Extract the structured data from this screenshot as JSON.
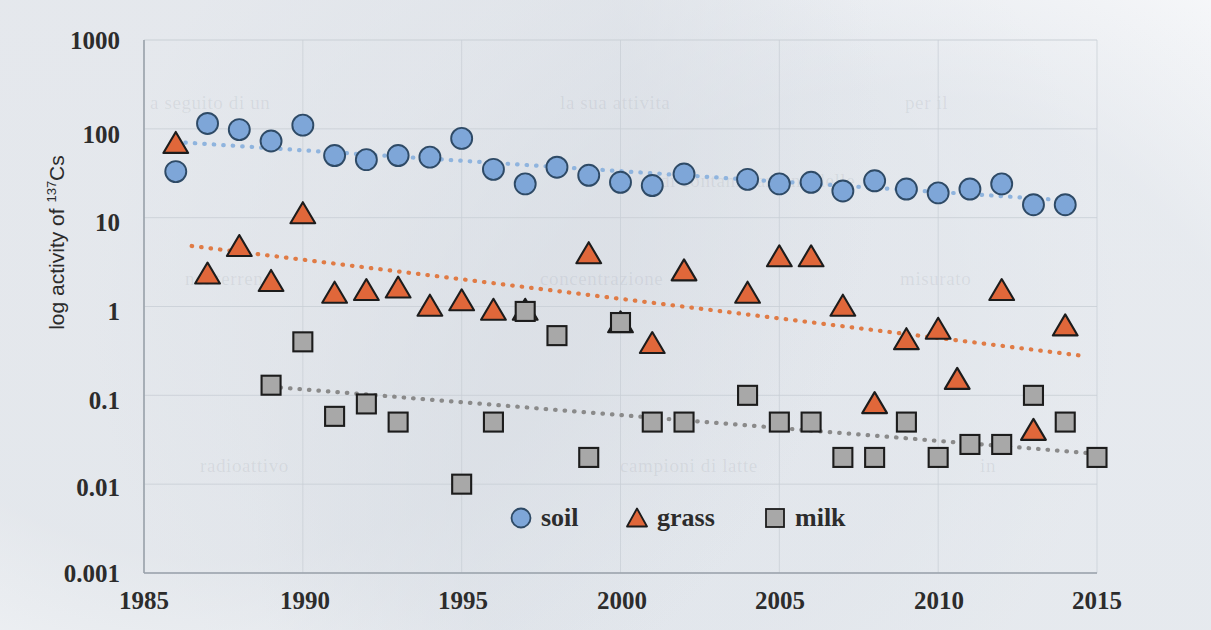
{
  "chart_data": {
    "type": "scatter",
    "title": "",
    "xlabel": "",
    "ylabel": "log activity of 137Cs",
    "ylabel_main": "log activity of ",
    "ylabel_sup": "137",
    "ylabel_tail": "Cs",
    "xlim": [
      1985,
      2015
    ],
    "ylim": [
      0.001,
      1000
    ],
    "yscale": "log",
    "xscale": "linear",
    "grid": true,
    "legend_position": "bottom-center",
    "xticks": [
      "1985",
      "1990",
      "1995",
      "2000",
      "2005",
      "2010",
      "2015"
    ],
    "xtick_values": [
      1985,
      1990,
      1995,
      2000,
      2005,
      2010,
      2015
    ],
    "yticks": [
      "1000",
      "100",
      "10",
      "1",
      "0.1",
      "0.01",
      "0.001"
    ],
    "ytick_values": [
      1000,
      100,
      10,
      1,
      0.1,
      0.01,
      0.001
    ],
    "colors": {
      "soil": "#7EA6D8",
      "soil_edge": "#2e4a66",
      "grass": "#E0673A",
      "grass_edge": "#1c1c1c",
      "milk": "#A8A8A8",
      "milk_edge": "#1c1c1c",
      "soil_trend": "#8FB4DE",
      "grass_trend": "#E07B45",
      "milk_trend": "#8A8A8A",
      "grid": "#c9cfd6",
      "axis": "#9aa2ab",
      "text": "#2c2c2c"
    },
    "series": [
      {
        "name": "soil",
        "marker": "circle",
        "color": "#7EA6D8",
        "points": [
          {
            "x": 1986,
            "y": 33
          },
          {
            "x": 1987,
            "y": 115
          },
          {
            "x": 1988,
            "y": 98
          },
          {
            "x": 1989,
            "y": 73
          },
          {
            "x": 1990,
            "y": 110
          },
          {
            "x": 1991,
            "y": 50
          },
          {
            "x": 1992,
            "y": 45
          },
          {
            "x": 1993,
            "y": 50
          },
          {
            "x": 1994,
            "y": 48
          },
          {
            "x": 1995,
            "y": 78
          },
          {
            "x": 1996,
            "y": 35
          },
          {
            "x": 1997,
            "y": 24
          },
          {
            "x": 1998,
            "y": 37
          },
          {
            "x": 1999,
            "y": 30
          },
          {
            "x": 2000,
            "y": 25
          },
          {
            "x": 2001,
            "y": 23
          },
          {
            "x": 2002,
            "y": 31
          },
          {
            "x": 2004,
            "y": 27
          },
          {
            "x": 2005,
            "y": 24
          },
          {
            "x": 2006,
            "y": 25
          },
          {
            "x": 2007,
            "y": 20
          },
          {
            "x": 2008,
            "y": 26
          },
          {
            "x": 2009,
            "y": 21
          },
          {
            "x": 2010,
            "y": 19
          },
          {
            "x": 2011,
            "y": 21
          },
          {
            "x": 2012,
            "y": 24
          },
          {
            "x": 2013,
            "y": 14
          },
          {
            "x": 2014,
            "y": 14
          }
        ],
        "trend": {
          "x_start": 1986.3,
          "y_start": 70,
          "x_end": 2014.2,
          "y_end": 15.5
        }
      },
      {
        "name": "grass",
        "marker": "triangle",
        "color": "#E0673A",
        "points": [
          {
            "x": 1986,
            "y": 68
          },
          {
            "x": 1987,
            "y": 2.3
          },
          {
            "x": 1988,
            "y": 4.7
          },
          {
            "x": 1989,
            "y": 1.9
          },
          {
            "x": 1990,
            "y": 11
          },
          {
            "x": 1991,
            "y": 1.4
          },
          {
            "x": 1992,
            "y": 1.5
          },
          {
            "x": 1993,
            "y": 1.6
          },
          {
            "x": 1994,
            "y": 1.0
          },
          {
            "x": 1995,
            "y": 1.15
          },
          {
            "x": 1996,
            "y": 0.9
          },
          {
            "x": 1997,
            "y": 0.9
          },
          {
            "x": 1999,
            "y": 3.9
          },
          {
            "x": 2000,
            "y": 0.65
          },
          {
            "x": 2001,
            "y": 0.38
          },
          {
            "x": 2002,
            "y": 2.5
          },
          {
            "x": 2004,
            "y": 1.4
          },
          {
            "x": 2005,
            "y": 3.6
          },
          {
            "x": 2006,
            "y": 3.6
          },
          {
            "x": 2007,
            "y": 1.0
          },
          {
            "x": 2008,
            "y": 0.08
          },
          {
            "x": 2009,
            "y": 0.42
          },
          {
            "x": 2010,
            "y": 0.55
          },
          {
            "x": 2010.6,
            "y": 0.15
          },
          {
            "x": 2012,
            "y": 1.5
          },
          {
            "x": 2013,
            "y": 0.04
          },
          {
            "x": 2014,
            "y": 0.6
          }
        ],
        "trend": {
          "x_start": 1986.5,
          "y_start": 4.8,
          "x_end": 2014.5,
          "y_end": 0.28
        }
      },
      {
        "name": "milk",
        "marker": "square",
        "color": "#A8A8A8",
        "points": [
          {
            "x": 1989,
            "y": 0.13
          },
          {
            "x": 1990,
            "y": 0.4
          },
          {
            "x": 1991,
            "y": 0.058
          },
          {
            "x": 1992,
            "y": 0.08
          },
          {
            "x": 1993,
            "y": 0.05
          },
          {
            "x": 1995,
            "y": 0.01
          },
          {
            "x": 1996,
            "y": 0.05
          },
          {
            "x": 1997,
            "y": 0.88
          },
          {
            "x": 1998,
            "y": 0.47
          },
          {
            "x": 1999,
            "y": 0.02
          },
          {
            "x": 2000,
            "y": 0.66
          },
          {
            "x": 2001,
            "y": 0.05
          },
          {
            "x": 2002,
            "y": 0.05
          },
          {
            "x": 2004,
            "y": 0.1
          },
          {
            "x": 2005,
            "y": 0.05
          },
          {
            "x": 2006,
            "y": 0.05
          },
          {
            "x": 2007,
            "y": 0.02
          },
          {
            "x": 2008,
            "y": 0.02
          },
          {
            "x": 2009,
            "y": 0.05
          },
          {
            "x": 2010,
            "y": 0.02
          },
          {
            "x": 2011,
            "y": 0.028
          },
          {
            "x": 2012,
            "y": 0.028
          },
          {
            "x": 2013,
            "y": 0.1
          },
          {
            "x": 2014,
            "y": 0.05
          },
          {
            "x": 2015,
            "y": 0.02
          }
        ],
        "trend": {
          "x_start": 1989.0,
          "y_start": 0.125,
          "x_end": 2015.0,
          "y_end": 0.022
        }
      }
    ],
    "legend": [
      {
        "label": "soil",
        "marker": "circle",
        "color": "#7EA6D8"
      },
      {
        "label": "grass",
        "marker": "triangle",
        "color": "#E0673A"
      },
      {
        "label": "milk",
        "marker": "square",
        "color": "#A8A8A8"
      }
    ]
  },
  "ghost_text": [
    {
      "text": "a seguito di un",
      "x": 150,
      "y": 92
    },
    {
      "text": "la sua attivita",
      "x": 560,
      "y": 92
    },
    {
      "text": "per il",
      "x": 905,
      "y": 92
    },
    {
      "text": "di contaminazione delle",
      "x": 660,
      "y": 170
    },
    {
      "text": "nel terreno",
      "x": 185,
      "y": 268
    },
    {
      "text": "concentrazione",
      "x": 540,
      "y": 268
    },
    {
      "text": "misurato",
      "x": 900,
      "y": 268
    },
    {
      "text": "radioattivo",
      "x": 200,
      "y": 455
    },
    {
      "text": "campioni di latte",
      "x": 620,
      "y": 455
    },
    {
      "text": "in",
      "x": 980,
      "y": 455
    }
  ]
}
